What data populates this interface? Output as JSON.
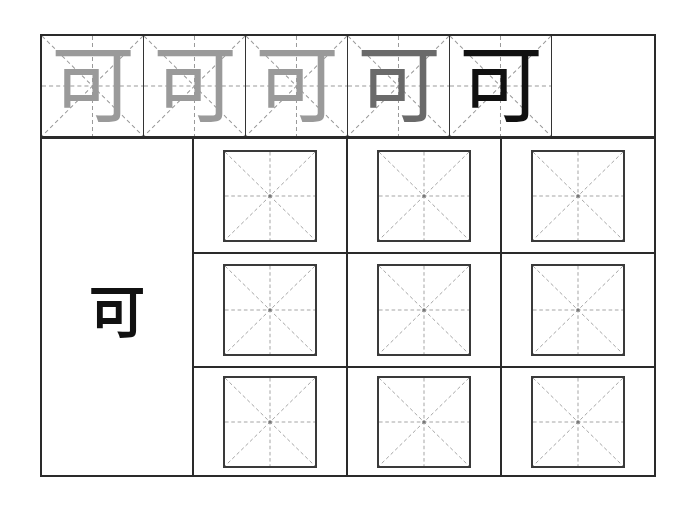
{
  "sheet": {
    "character": "可",
    "stroke_order": [
      {
        "step": 1,
        "label": "可"
      },
      {
        "step": 2,
        "label": "可"
      },
      {
        "step": 3,
        "label": "可"
      },
      {
        "step": 4,
        "label": "可"
      },
      {
        "step": 5,
        "label": "可"
      }
    ],
    "model_character": "可",
    "practice_grid": {
      "rows": 3,
      "cols": 3
    },
    "colors": {
      "line": "#2a2a2a",
      "guide": "#9a9a9a",
      "ghost_stroke": "#9a9a9a",
      "ink": "#111111"
    }
  }
}
